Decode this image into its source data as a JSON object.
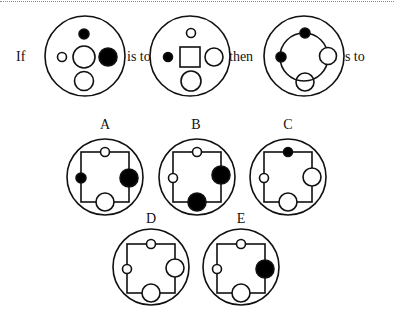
{
  "question": {
    "words": {
      "if": "If",
      "is_to_1": "is to",
      "then": "then",
      "is_to_2": "is to"
    }
  },
  "options": [
    {
      "label": "A"
    },
    {
      "label": "B"
    },
    {
      "label": "C"
    },
    {
      "label": "D"
    },
    {
      "label": "E"
    }
  ],
  "colors": {
    "stroke": "#111111",
    "fill_dark": "#000000",
    "fill_light": "#ffffff"
  }
}
